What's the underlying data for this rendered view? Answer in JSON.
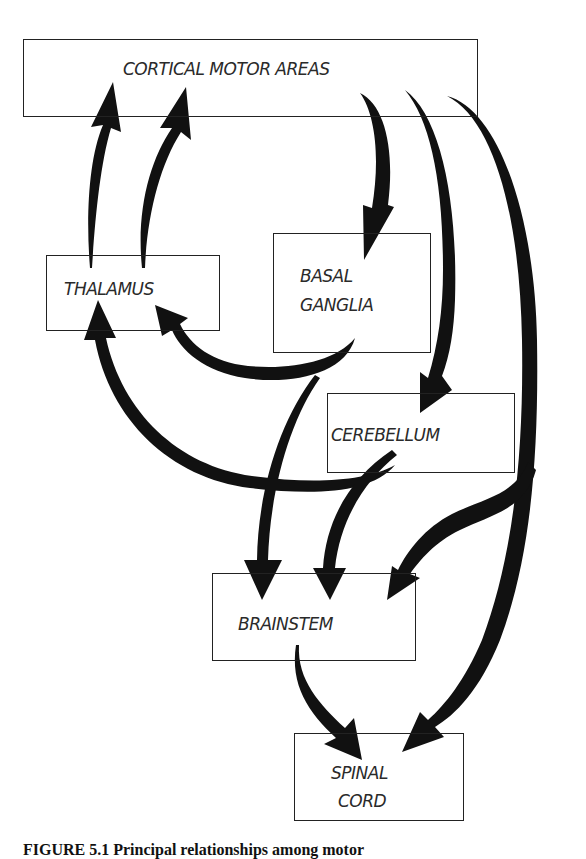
{
  "diagram": {
    "nodes": {
      "cortex": {
        "label": "CORTICAL MOTOR AREAS"
      },
      "thalamus": {
        "label": "THALAMUS"
      },
      "basal_ganglia": {
        "line1": "BASAL",
        "line2": "GANGLIA"
      },
      "cerebellum": {
        "label": "CEREBELLUM"
      },
      "brainstem": {
        "label": "BRAINSTEM"
      },
      "spinal_cord": {
        "line1": "SPINAL",
        "line2": "CORD"
      }
    },
    "edges": [
      {
        "from": "THALAMUS",
        "to": "CORTICAL MOTOR AREAS"
      },
      {
        "from": "THALAMUS",
        "to": "CORTICAL MOTOR AREAS"
      },
      {
        "from": "CORTICAL MOTOR AREAS",
        "to": "BASAL GANGLIA"
      },
      {
        "from": "CORTICAL MOTOR AREAS",
        "to": "CEREBELLUM"
      },
      {
        "from": "CORTICAL MOTOR AREAS",
        "to": "BRAINSTEM"
      },
      {
        "from": "CORTICAL MOTOR AREAS",
        "to": "SPINAL CORD"
      },
      {
        "from": "BASAL GANGLIA",
        "to": "THALAMUS"
      },
      {
        "from": "BASAL GANGLIA",
        "to": "BRAINSTEM"
      },
      {
        "from": "CEREBELLUM",
        "to": "THALAMUS"
      },
      {
        "from": "CEREBELLUM",
        "to": "BRAINSTEM"
      },
      {
        "from": "BRAINSTEM",
        "to": "SPINAL CORD"
      }
    ],
    "colors": {
      "arrow": "#111111",
      "border": "#222222",
      "text": "#2a2a2a"
    }
  },
  "caption": {
    "text": "FIGURE 5.1 Principal relationships among motor"
  }
}
